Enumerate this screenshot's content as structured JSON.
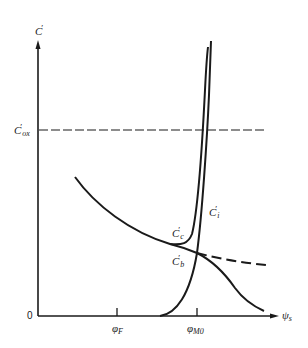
{
  "figure": {
    "type": "MOS capacitor C-V diagram",
    "y_axis": {
      "symbol": "C",
      "prime": "′",
      "origin_label": "0"
    },
    "x_axis": {
      "symbol": "ψ",
      "subscript": "s"
    },
    "ticks": [
      {
        "symbol": "φ",
        "subscript": "F"
      },
      {
        "symbol": "φ",
        "subscript": "M0"
      }
    ],
    "reference_line": {
      "symbol": "C",
      "prime": "′",
      "subscript": "ox",
      "style": "dashed"
    },
    "curve_labels": [
      {
        "id": "c",
        "symbol": "C",
        "prime": "′",
        "subscript": "c"
      },
      {
        "id": "i",
        "symbol": "C",
        "prime": "′",
        "subscript": "i"
      },
      {
        "id": "b",
        "symbol": "C",
        "prime": "′",
        "subscript": "b"
      }
    ],
    "colors": {
      "ink": "#1a1a1a",
      "background": "#ffffff"
    }
  }
}
